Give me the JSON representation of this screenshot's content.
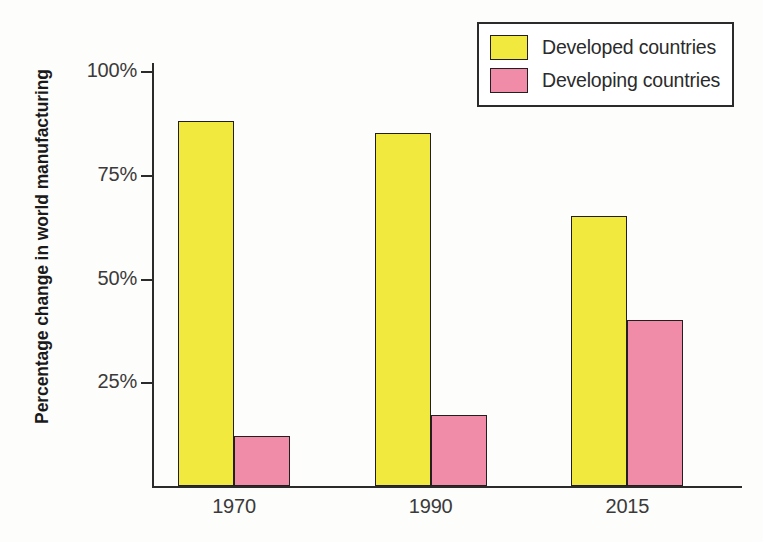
{
  "chart_data": {
    "type": "bar",
    "title": "",
    "subtitle": "",
    "xlabel": "",
    "ylabel": "Percentage change in world manufacturing",
    "categories": [
      "1970",
      "1990",
      "2015"
    ],
    "series": [
      {
        "name": "Developed countries",
        "color": "#f2e93f",
        "values": [
          88,
          85,
          65
        ]
      },
      {
        "name": "Developing countries",
        "color": "#f08ba8",
        "values": [
          12,
          17,
          40
        ]
      }
    ],
    "ylim": [
      0,
      100
    ],
    "ytick_values": [
      100,
      75,
      50,
      25
    ],
    "ytick_labels": [
      "100%",
      "75%",
      "50%",
      "25%"
    ],
    "grid": false,
    "legend_position": "top-right",
    "value_suffix": "%"
  },
  "legend": {
    "entries": [
      {
        "label": "Developed countries",
        "color": "#f2e93f"
      },
      {
        "label": "Developing countries",
        "color": "#f08ba8"
      }
    ]
  },
  "axis": {
    "y_title": "Percentage change in world manufacturing",
    "tick_labels": [
      "100%",
      "75%",
      "50%",
      "25%"
    ],
    "category_labels": [
      "1970",
      "1990",
      "2015"
    ]
  },
  "colors": {
    "developed": "#f2e93f",
    "developing": "#f08ba8",
    "axis": "#2b2b2b",
    "bar_outline": "#231f20",
    "background": "#fdfdfb"
  }
}
